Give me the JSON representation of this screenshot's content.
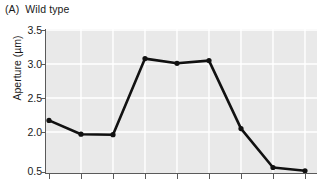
{
  "panel": {
    "letter": "(A)",
    "title": "Wild type"
  },
  "axes": {
    "y_title": "Aperture (µm)",
    "x_title": ""
  },
  "chart_data": {
    "type": "line",
    "title": "Wild type",
    "panel_label": "(A)",
    "xlabel": "",
    "ylabel": "Aperture (µm)",
    "ylim": [
      0.5,
      3.5
    ],
    "y_ticks": [
      3.5,
      3.0,
      2.5,
      2.0,
      0.5
    ],
    "y_tick_labels": [
      "3.5",
      "3.0",
      "2.5",
      "2.0",
      "0.5"
    ],
    "x_ticks": [
      1,
      2,
      3,
      4,
      5,
      6,
      7,
      8,
      9
    ],
    "x_tick_labels": [
      "",
      "",
      "",
      "",
      "",
      "",
      "",
      "",
      ""
    ],
    "grid": true,
    "grid_color": "#ffffff",
    "plot_background": "#e9e9e9",
    "legend": null,
    "series": [
      {
        "name": "Wild type aperture",
        "color": "#111111",
        "marker": "circle",
        "x": [
          1,
          2,
          3,
          4,
          5,
          6,
          7,
          8,
          9
        ],
        "values": [
          2.17,
          1.92,
          1.9,
          3.08,
          3.01,
          3.05,
          2.05,
          0.7,
          0.58
        ]
      }
    ]
  },
  "colors": {
    "line": "#111111",
    "plot_bg": "#e9e9e9",
    "grid": "#ffffff",
    "axis": "#5a5a5a",
    "text": "#1a1a1a"
  }
}
